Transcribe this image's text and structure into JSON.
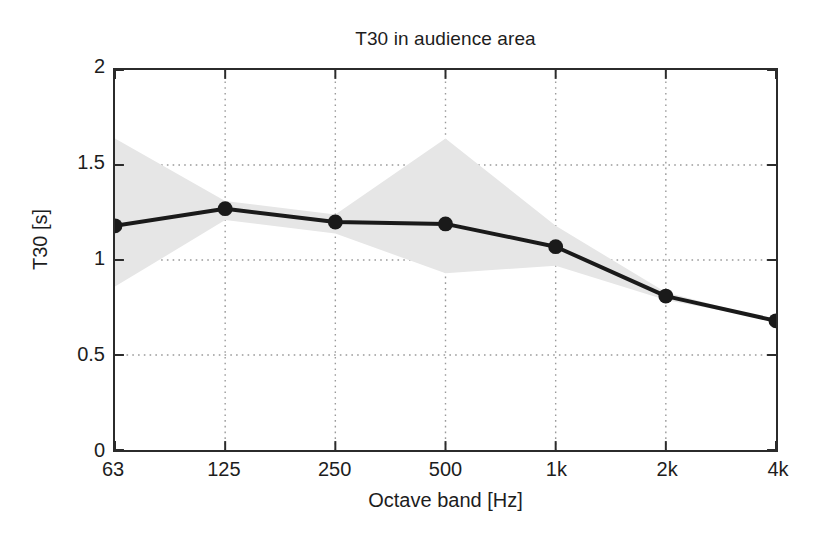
{
  "chart_data": {
    "type": "line",
    "title": "T30 in audience area",
    "xlabel": "Octave band [Hz]",
    "ylabel": "T30 [s]",
    "categories": [
      "63",
      "125",
      "250",
      "500",
      "1k",
      "2k",
      "4k"
    ],
    "x_tick_labels": [
      "63",
      "125",
      "250",
      "500",
      "1k",
      "2k",
      "4k"
    ],
    "y_tick_labels": [
      "0",
      "0.5",
      "1",
      "1.5",
      "2"
    ],
    "y_tick_values": [
      0,
      0.5,
      1,
      1.5,
      2
    ],
    "ylim": [
      0,
      2
    ],
    "xlim": [
      0,
      6
    ],
    "grid": true,
    "grid_style": "dotted",
    "legend": "none",
    "series": [
      {
        "name": "T30 mean",
        "marker": "filled-circle",
        "color": "#1a1a1a",
        "values": [
          1.18,
          1.27,
          1.2,
          1.19,
          1.07,
          0.81,
          0.68
        ]
      }
    ],
    "band": {
      "name": "spatial spread",
      "color": "#e6e6e6",
      "upper": [
        1.64,
        1.31,
        1.24,
        1.64,
        1.18,
        0.83,
        0.68
      ],
      "lower": [
        0.86,
        1.21,
        1.14,
        0.93,
        0.97,
        0.79,
        0.68
      ]
    }
  },
  "chart": {
    "title": "T30 in audience area",
    "x_axis_title": "Octave band [Hz]",
    "y_axis_title": "T30 [s]"
  },
  "colors": {
    "line": "#1a1a1a",
    "band": "#e6e6e6",
    "axis": "#2b2b2b",
    "grid": "#9a9a9a",
    "background": "#ffffff",
    "text": "#1d1d1d"
  }
}
